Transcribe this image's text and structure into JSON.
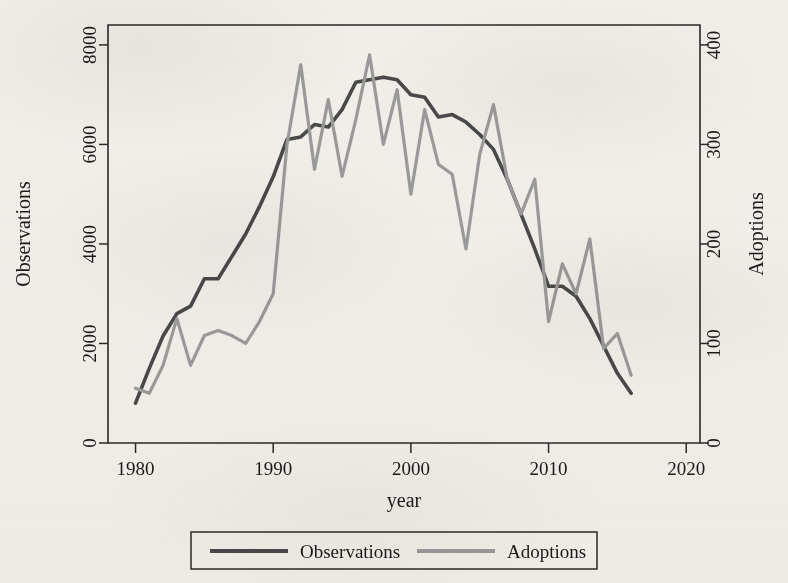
{
  "chart_data": {
    "type": "line",
    "title": "",
    "xlabel": "year",
    "ylabel": "Observations",
    "y2label": "Adoptions",
    "xlim": [
      1978,
      2021
    ],
    "ylim": [
      0,
      8400
    ],
    "y2lim": [
      0,
      420
    ],
    "grid": false,
    "legend_position": "bottom",
    "xticks": [
      "1980",
      "1990",
      "2000",
      "2010",
      "2020"
    ],
    "xtick_values": [
      1980,
      1990,
      2000,
      2010,
      2020
    ],
    "yticks": [
      "0",
      "2000",
      "4000",
      "6000",
      "8000"
    ],
    "ytick_values": [
      0,
      2000,
      4000,
      6000,
      8000
    ],
    "y2ticks": [
      "0",
      "100",
      "200",
      "300",
      "400"
    ],
    "y2tick_values": [
      0,
      100,
      200,
      300,
      400
    ],
    "x": [
      1980,
      1981,
      1982,
      1983,
      1984,
      1985,
      1986,
      1987,
      1988,
      1989,
      1990,
      1991,
      1992,
      1993,
      1994,
      1995,
      1996,
      1997,
      1998,
      1999,
      2000,
      2001,
      2002,
      2003,
      2004,
      2005,
      2006,
      2007,
      2008,
      2009,
      2010,
      2011,
      2012,
      2013,
      2014,
      2015,
      2016
    ],
    "series": [
      {
        "name": "Observations",
        "axis": "left",
        "color": "#4a4a4a",
        "width": 3.6,
        "values": [
          800,
          1500,
          2150,
          2600,
          2750,
          3300,
          3300,
          3750,
          4200,
          4750,
          5350,
          6100,
          6150,
          6400,
          6350,
          6700,
          7250,
          7300,
          7350,
          7300,
          7000,
          6950,
          6550,
          6600,
          6450,
          6200,
          5900,
          5300,
          4600,
          3900,
          3150,
          3150,
          2950,
          2500,
          1950,
          1400,
          1000
        ]
      },
      {
        "name": "Adoptions",
        "axis": "right",
        "color": "#9c9c9c",
        "width": 3.2,
        "values": [
          55,
          50,
          78,
          125,
          78,
          108,
          113,
          108,
          100,
          122,
          150,
          300,
          380,
          275,
          345,
          268,
          325,
          390,
          300,
          355,
          250,
          335,
          280,
          270,
          195,
          290,
          340,
          265,
          230,
          265,
          122,
          180,
          150,
          205,
          95,
          110,
          68
        ]
      }
    ]
  },
  "legend": {
    "entries": [
      {
        "label": "Observations",
        "color": "#4a4a4a"
      },
      {
        "label": "Adoptions",
        "color": "#9c9c9c"
      }
    ]
  }
}
